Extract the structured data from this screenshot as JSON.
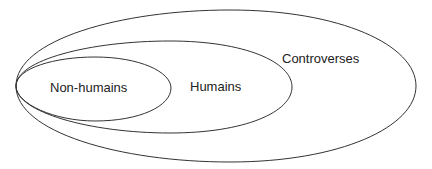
{
  "diagram": {
    "type": "nested-ellipses",
    "stroke_color": "#333333",
    "background": "#ffffff",
    "sets": [
      {
        "id": "controverses",
        "label": "Controverses",
        "contains": [
          "humains"
        ]
      },
      {
        "id": "humains",
        "label": "Humains",
        "contains": [
          "non-humains"
        ]
      },
      {
        "id": "non-humains",
        "label": "Non-humains",
        "contains": []
      }
    ],
    "labels": {
      "outer": "Controverses",
      "middle": "Humains",
      "inner": "Non-humains"
    }
  }
}
